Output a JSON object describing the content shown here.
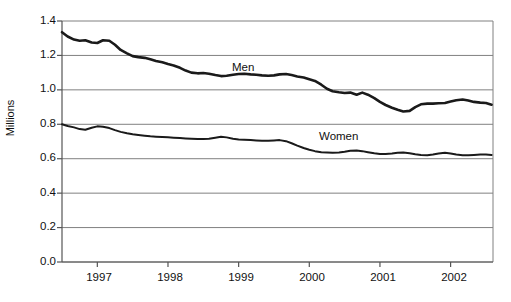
{
  "chart_data": {
    "type": "line",
    "title": "",
    "subtitle": "",
    "xlabel": "",
    "ylabel": "Millions",
    "ylim": [
      0.0,
      1.4
    ],
    "ytick_labels": [
      "1.4",
      "1.2",
      "1.0",
      "0.8",
      "0.6",
      "0.4",
      "0.2",
      "0.0"
    ],
    "ytick_values": [
      1.4,
      1.2,
      1.0,
      0.8,
      0.6,
      0.4,
      0.2,
      0.0
    ],
    "xtick_labels": [
      "1997",
      "1998",
      "1999",
      "2000",
      "2001",
      "2002"
    ],
    "xlim": [
      1996.5,
      2002.6
    ],
    "xtick_values": [
      1997,
      1998,
      1999,
      2000,
      2001,
      2002
    ],
    "grid": "horizontal",
    "legend_position": "inline-annotation",
    "annotations": [
      {
        "text": "Men",
        "x": 1998.9,
        "y": 1.1
      },
      {
        "text": "Women",
        "x": 2000.0,
        "y": 0.735
      }
    ],
    "line_color": "#1a1a1a",
    "series": [
      {
        "name": "Men",
        "line_width": 2.6,
        "x": [
          1996.5,
          1996.58,
          1996.67,
          1996.75,
          1996.83,
          1996.92,
          1997.0,
          1997.08,
          1997.17,
          1997.25,
          1997.33,
          1997.42,
          1997.5,
          1997.58,
          1997.67,
          1997.75,
          1997.83,
          1997.92,
          1998.0,
          1998.08,
          1998.17,
          1998.25,
          1998.33,
          1998.42,
          1998.5,
          1998.58,
          1998.67,
          1998.75,
          1998.83,
          1998.92,
          1999.0,
          1999.08,
          1999.17,
          1999.25,
          1999.33,
          1999.42,
          1999.5,
          1999.58,
          1999.67,
          1999.75,
          1999.83,
          1999.92,
          2000.0,
          2000.08,
          2000.17,
          2000.25,
          2000.33,
          2000.42,
          2000.5,
          2000.58,
          2000.67,
          2000.75,
          2000.83,
          2000.92,
          2001.0,
          2001.08,
          2001.17,
          2001.25,
          2001.33,
          2001.42,
          2001.5,
          2001.58,
          2001.67,
          2001.75,
          2001.83,
          2001.92,
          2002.0,
          2002.08,
          2002.17,
          2002.25,
          2002.33,
          2002.42,
          2002.5,
          2002.58
        ],
        "values": [
          1.335,
          1.31,
          1.292,
          1.285,
          1.288,
          1.275,
          1.272,
          1.288,
          1.285,
          1.262,
          1.232,
          1.212,
          1.196,
          1.19,
          1.186,
          1.178,
          1.168,
          1.16,
          1.15,
          1.142,
          1.128,
          1.112,
          1.1,
          1.096,
          1.098,
          1.094,
          1.086,
          1.08,
          1.082,
          1.088,
          1.092,
          1.094,
          1.09,
          1.088,
          1.084,
          1.082,
          1.084,
          1.09,
          1.092,
          1.086,
          1.078,
          1.072,
          1.062,
          1.052,
          1.03,
          1.006,
          0.992,
          0.986,
          0.982,
          0.984,
          0.972,
          0.984,
          0.972,
          0.952,
          0.93,
          0.912,
          0.896,
          0.884,
          0.874,
          0.878,
          0.9,
          0.916,
          0.92,
          0.92,
          0.922,
          0.924,
          0.932,
          0.94,
          0.944,
          0.938,
          0.93,
          0.926,
          0.924,
          0.914
        ]
      },
      {
        "name": "Women",
        "line_width": 2.0,
        "x": [
          1996.5,
          1996.58,
          1996.67,
          1996.75,
          1996.83,
          1996.92,
          1997.0,
          1997.08,
          1997.17,
          1997.25,
          1997.33,
          1997.42,
          1997.5,
          1997.58,
          1997.67,
          1997.75,
          1997.83,
          1997.92,
          1998.0,
          1998.08,
          1998.17,
          1998.25,
          1998.33,
          1998.42,
          1998.5,
          1998.58,
          1998.67,
          1998.75,
          1998.83,
          1998.92,
          1999.0,
          1999.08,
          1999.17,
          1999.25,
          1999.33,
          1999.42,
          1999.5,
          1999.58,
          1999.67,
          1999.75,
          1999.83,
          1999.92,
          2000.0,
          2000.08,
          2000.17,
          2000.25,
          2000.33,
          2000.42,
          2000.5,
          2000.58,
          2000.67,
          2000.75,
          2000.83,
          2000.92,
          2001.0,
          2001.08,
          2001.17,
          2001.25,
          2001.33,
          2001.42,
          2001.5,
          2001.58,
          2001.67,
          2001.75,
          2001.83,
          2001.92,
          2002.0,
          2002.08,
          2002.17,
          2002.25,
          2002.33,
          2002.42,
          2002.5,
          2002.58
        ],
        "values": [
          0.8,
          0.79,
          0.782,
          0.772,
          0.768,
          0.78,
          0.788,
          0.786,
          0.778,
          0.766,
          0.756,
          0.748,
          0.742,
          0.738,
          0.734,
          0.73,
          0.728,
          0.726,
          0.724,
          0.722,
          0.72,
          0.718,
          0.716,
          0.714,
          0.714,
          0.716,
          0.722,
          0.728,
          0.724,
          0.716,
          0.712,
          0.71,
          0.708,
          0.706,
          0.704,
          0.704,
          0.706,
          0.708,
          0.702,
          0.69,
          0.676,
          0.662,
          0.652,
          0.644,
          0.638,
          0.636,
          0.634,
          0.636,
          0.64,
          0.646,
          0.648,
          0.644,
          0.638,
          0.632,
          0.628,
          0.628,
          0.63,
          0.634,
          0.636,
          0.632,
          0.626,
          0.622,
          0.62,
          0.624,
          0.63,
          0.634,
          0.63,
          0.624,
          0.62,
          0.62,
          0.622,
          0.624,
          0.624,
          0.622
        ]
      }
    ]
  }
}
